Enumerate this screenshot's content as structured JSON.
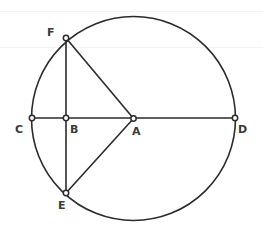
{
  "figure": {
    "width": 263,
    "height": 233,
    "background_color": "#ffffff",
    "stroke_color": "#2b2b2b",
    "label_color": "#3a3a3a",
    "marker_fill": "#ffffff",
    "stroke_width": 1.6
  },
  "circle": {
    "center_x": 133.5,
    "center_y": 118.5,
    "radius": 102,
    "center_point": "A"
  },
  "points": [
    {
      "id": "F",
      "label": "F",
      "x": 66,
      "y": 38,
      "label_x": 47,
      "label_y": 27,
      "on_circle": true
    },
    {
      "id": "C",
      "label": "C",
      "x": 32,
      "y": 118,
      "label_x": 15,
      "label_y": 124,
      "on_circle": true
    },
    {
      "id": "B",
      "label": "B",
      "x": 66,
      "y": 118,
      "label_x": 70,
      "label_y": 124,
      "on_circle": false
    },
    {
      "id": "A",
      "label": "A",
      "x": 133.5,
      "y": 118.5,
      "label_x": 132,
      "label_y": 126,
      "on_circle": false
    },
    {
      "id": "D",
      "label": "D",
      "x": 235,
      "y": 118,
      "label_x": 238,
      "label_y": 124,
      "on_circle": true
    },
    {
      "id": "E",
      "label": "E",
      "x": 66,
      "y": 193,
      "label_x": 58,
      "label_y": 200,
      "on_circle": true
    }
  ],
  "segments": [
    {
      "id": "CD",
      "from": "C",
      "to": "D",
      "role": "diameter"
    },
    {
      "id": "FE",
      "from": "F",
      "to": "E",
      "role": "chord"
    },
    {
      "id": "FA",
      "from": "F",
      "to": "A",
      "role": "radius"
    },
    {
      "id": "EA",
      "from": "E",
      "to": "A",
      "role": "radius"
    }
  ],
  "markers": {
    "radius": 2.7,
    "stroke_width": 1.5
  },
  "artifacts": [
    {
      "y": 11
    },
    {
      "y": 47
    }
  ]
}
